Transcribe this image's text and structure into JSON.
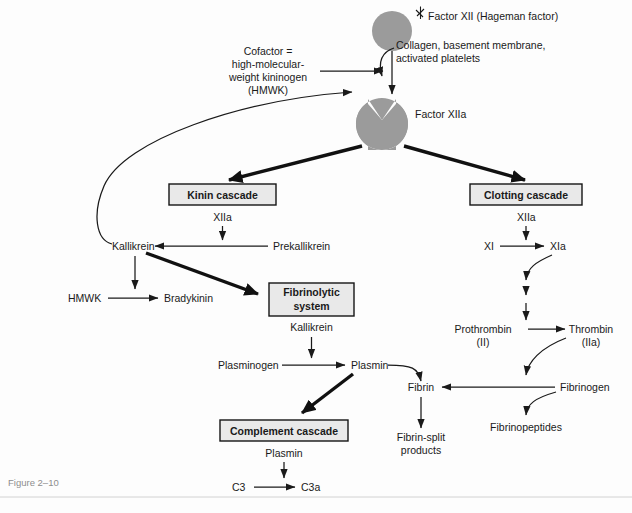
{
  "figure": {
    "caption": "Figure 2–10",
    "background_color": "#fdfdfd",
    "blob_color": "#9b9b9b",
    "box_fill_color": "#e9e9e9",
    "box_border_color": "#141414",
    "text_color": "#1a1a1a",
    "caption_color": "#8d8d8d"
  },
  "nodes": {
    "factor_xii": "Factor XII (Hageman factor)",
    "activators": {
      "line1": "Collagen, basement membrane,",
      "line2": "activated platelets"
    },
    "cofactor": {
      "line1": "Cofactor =",
      "line2": "high-molecular-",
      "line3": "weight kininogen",
      "line4": "(HMWK)"
    },
    "factor_xiia": "Factor XIIa",
    "kinin_cascade": "Kinin cascade",
    "clotting_cascade": "Clotting cascade",
    "fibrinolytic_system": {
      "line1": "Fibrinolytic",
      "line2": "system"
    },
    "complement_cascade": "Complement cascade",
    "xiia_kinin": "XIIa",
    "xiia_clotting": "XIIa",
    "kallikrein": "Kallikrein",
    "prekallikrein": "Prekallikrein",
    "hmwk": "HMWK",
    "bradykinin": "Bradykinin",
    "kallikrein_fibrinolytic": "Kallikrein",
    "plasminogen": "Plasminogen",
    "plasmin": "Plasmin",
    "plasmin_complement": "Plasmin",
    "c3": "C3",
    "c3a": "C3a",
    "fibrin": "Fibrin",
    "fibrin_split": {
      "line1": "Fibrin-split",
      "line2": "products"
    },
    "xi": "XI",
    "xia": "XIa",
    "prothrombin": {
      "line1": "Prothrombin",
      "line2": "(II)"
    },
    "thrombin": {
      "line1": "Thrombin",
      "line2": "(IIa)"
    },
    "fibrinogen": "Fibrinogen",
    "fibrinopeptides": "Fibrinopeptides"
  }
}
